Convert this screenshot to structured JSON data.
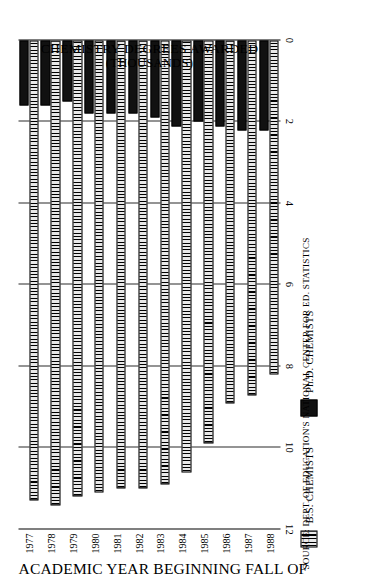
{
  "chart_data": {
    "type": "bar",
    "orientation": "horizontal",
    "title": "",
    "xlabel": "ACADEMIC YEAR BEGINNING FALL OF",
    "ylabel": "CHEMISTRY DEGREES AWARDED",
    "ylabel_line2": "(THOUSANDS)",
    "categories": [
      "1977",
      "1978",
      "1979",
      "1980",
      "1981",
      "1982",
      "1983",
      "1984",
      "1985",
      "1986",
      "1987",
      "1988"
    ],
    "value_ticks": [
      "12",
      "10",
      "8",
      "6",
      "4",
      "2",
      "0"
    ],
    "value_tick_numbers": [
      12,
      10,
      8,
      6,
      4,
      2,
      0
    ],
    "ylim": [
      0,
      12
    ],
    "grid": true,
    "legend_position": "bottom",
    "units": "thousands",
    "series": [
      {
        "name": "B.S. CHEMISTS",
        "key": "bs",
        "fill": "vertical-hatch",
        "color": "#d8d8d8",
        "values": [
          11.3,
          11.4,
          11.2,
          11.1,
          11.0,
          11.0,
          10.9,
          10.6,
          9.9,
          8.9,
          8.7,
          8.2
        ]
      },
      {
        "name": "Ph.D. CHEMISTS",
        "key": "phd",
        "fill": "solid",
        "color": "#111111",
        "values": [
          1.6,
          1.6,
          1.5,
          1.8,
          1.8,
          1.8,
          1.9,
          2.1,
          2.0,
          2.1,
          2.2,
          2.2
        ]
      }
    ],
    "source": "SOURCE:  DEPT. OF EDUCATION'S NATIONAL CENTER FOR ED. STATISTICS"
  },
  "legend": {
    "items": [
      {
        "label": "B.S. CHEMISTS",
        "key": "bs"
      },
      {
        "label": "Ph.D. CHEMISTS",
        "key": "phd"
      }
    ]
  },
  "axes": {
    "category_title": "ACADEMIC YEAR BEGINNING FALL OF",
    "value_title_line1": "CHEMISTRY DEGREES AWARDED",
    "value_title_line2": "(THOUSANDS)"
  },
  "footer": {
    "source": "SOURCE:  DEPT. OF EDUCATION'S NATIONAL CENTER FOR ED. STATISTICS"
  }
}
